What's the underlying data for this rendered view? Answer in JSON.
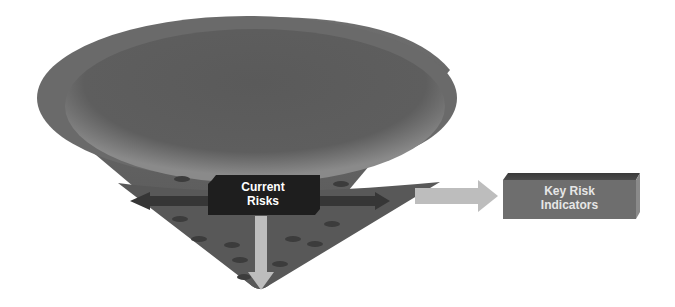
{
  "diagram": {
    "type": "funnel-cone",
    "nodes": {
      "current_risks": {
        "label_line1": "Current",
        "label_line2": "Risks"
      },
      "key_risk_indicators": {
        "label_line1": "Key Risk",
        "label_line2": "Indicators"
      }
    },
    "edges": [
      {
        "from": "current_risks",
        "to": "left",
        "style": "dark-arrow"
      },
      {
        "from": "current_risks",
        "to": "right",
        "style": "dark-arrow"
      },
      {
        "from": "current_risks",
        "to": "bottom",
        "style": "light-arrow"
      },
      {
        "from": "cone",
        "to": "key_risk_indicators",
        "style": "light-arrow"
      }
    ],
    "colors": {
      "cone_outer": "#6b6b6b",
      "cone_inner": "#5a5a5a",
      "box_dark": "#1e1e1e",
      "box_kri": "#6e6e6e",
      "arrow_light": "#bdbdbd",
      "arrow_dark": "#3a3a3a"
    }
  }
}
